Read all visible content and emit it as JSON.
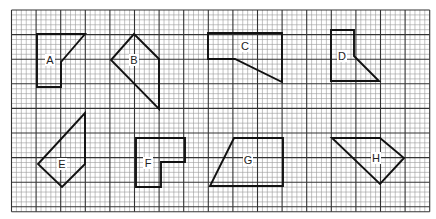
{
  "grid": {
    "x0": 11.5,
    "y0": 10,
    "cols": 85,
    "rows": 41,
    "cell": 4.92,
    "major_every": 5,
    "minor_color": "#9a9a9a",
    "major_color": "#333333"
  },
  "shapes": [
    {
      "id": "A",
      "label": "A",
      "label_pos": [
        50,
        60
      ],
      "points": [
        [
          37,
          34
        ],
        [
          85,
          34
        ],
        [
          61,
          62
        ],
        [
          61,
          87
        ],
        [
          37,
          87
        ]
      ]
    },
    {
      "id": "B",
      "label": "B",
      "label_pos": [
        134,
        60
      ],
      "points": [
        [
          134,
          34
        ],
        [
          159,
          59
        ],
        [
          159,
          109
        ],
        [
          111,
          60
        ]
      ]
    },
    {
      "id": "C",
      "label": "C",
      "label_pos": [
        245,
        46
      ],
      "points": [
        [
          208,
          33
        ],
        [
          282,
          33
        ],
        [
          282,
          82
        ],
        [
          235,
          59
        ],
        [
          208,
          59
        ]
      ]
    },
    {
      "id": "D",
      "label": "D",
      "label_pos": [
        342,
        56
      ],
      "points": [
        [
          331,
          30
        ],
        [
          354,
          30
        ],
        [
          354,
          56
        ],
        [
          379,
          81
        ],
        [
          331,
          81
        ]
      ]
    },
    {
      "id": "E",
      "label": "E",
      "label_pos": [
        62,
        164
      ],
      "points": [
        [
          85,
          113
        ],
        [
          85,
          164
        ],
        [
          62,
          187
        ],
        [
          38,
          164
        ]
      ]
    },
    {
      "id": "F",
      "label": "F",
      "label_pos": [
        148,
        163
      ],
      "points": [
        [
          136,
          138
        ],
        [
          185,
          138
        ],
        [
          185,
          162
        ],
        [
          161,
          162
        ],
        [
          161,
          187
        ],
        [
          136,
          187
        ]
      ]
    },
    {
      "id": "G",
      "label": "G",
      "label_pos": [
        248,
        160
      ],
      "points": [
        [
          234,
          138
        ],
        [
          283,
          138
        ],
        [
          283,
          186
        ],
        [
          210,
          186
        ]
      ]
    },
    {
      "id": "H",
      "label": "H",
      "label_pos": [
        376,
        158
      ],
      "points": [
        [
          332,
          138
        ],
        [
          380,
          138
        ],
        [
          404,
          158
        ],
        [
          380,
          184
        ]
      ]
    }
  ]
}
